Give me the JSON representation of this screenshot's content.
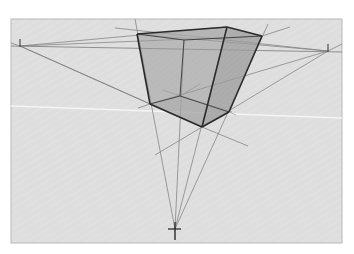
{
  "diagram": {
    "title": "Three-point perspective box (worm's-eye view)",
    "canvas": {
      "width": 354,
      "height": 254,
      "background": "#ffffff"
    },
    "paper": {
      "x": 11,
      "y": 19,
      "width": 331,
      "height": 224,
      "fill": "#dedede",
      "stroke": "#b8b8b8"
    },
    "colors": {
      "edge": "#2a2a2a",
      "hidden_edge": "#444444",
      "construction": "#7a7a7a",
      "face_fill": "#8c8c8c",
      "highlight_line": "#f4f4f4"
    },
    "vanishing_points": {
      "left": {
        "label": "VP-left",
        "x": 20,
        "y": 46
      },
      "right": {
        "label": "VP-right",
        "x": 328,
        "y": 51
      },
      "bottom": {
        "label": "VP-bottom",
        "x": 175,
        "y": 229
      }
    },
    "box_vertices": {
      "top_left": [
        137,
        34
      ],
      "top_back": [
        227,
        27
      ],
      "top_right": [
        262,
        36
      ],
      "top_hidden": [
        184,
        40
      ],
      "bottom_left": [
        150,
        104
      ],
      "bottom_front": [
        202,
        127
      ],
      "bottom_right": [
        229,
        112
      ],
      "bottom_hidden": [
        180,
        96
      ]
    }
  }
}
